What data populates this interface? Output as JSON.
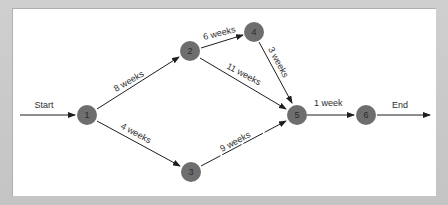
{
  "diagram": {
    "type": "network",
    "title": "",
    "terminals": {
      "start_label": "Start",
      "end_label": "End"
    },
    "nodes": [
      {
        "id": "1",
        "label": "1"
      },
      {
        "id": "2",
        "label": "2"
      },
      {
        "id": "3",
        "label": "3"
      },
      {
        "id": "4",
        "label": "4"
      },
      {
        "id": "5",
        "label": "5"
      },
      {
        "id": "6",
        "label": "6"
      }
    ],
    "edges": [
      {
        "from": "start",
        "to": "1",
        "label": "Start"
      },
      {
        "from": "1",
        "to": "2",
        "label": "8 weeks"
      },
      {
        "from": "1",
        "to": "3",
        "label": "4 weeks"
      },
      {
        "from": "2",
        "to": "4",
        "label": "6 weeks"
      },
      {
        "from": "2",
        "to": "5",
        "label": "11 weeks"
      },
      {
        "from": "4",
        "to": "5",
        "label": "3 weeks"
      },
      {
        "from": "3",
        "to": "5",
        "label": "9 weeks"
      },
      {
        "from": "5",
        "to": "6",
        "label": "1 week"
      },
      {
        "from": "6",
        "to": "end",
        "label": "End"
      }
    ],
    "colors": {
      "node_fill": "#6e6e6e",
      "edge": "#1e1e1e",
      "background": "#ffffff",
      "frame": "#c9c9c9"
    }
  }
}
